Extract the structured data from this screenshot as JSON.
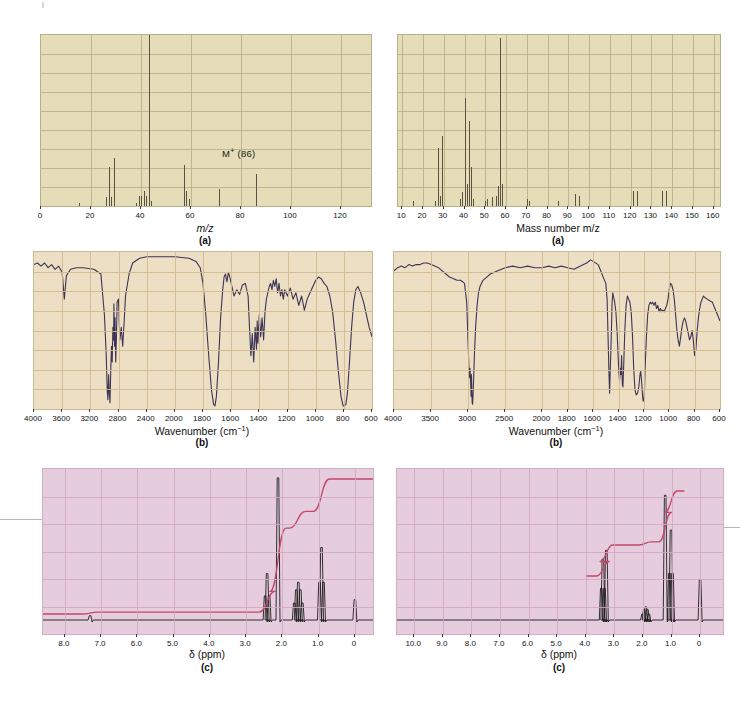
{
  "figure": {
    "panels": [
      {
        "id": "ms-left",
        "type": "mass-spectrum",
        "sublabel": "(a)",
        "axis_title": "m/z"
      },
      {
        "id": "ms-right",
        "type": "mass-spectrum",
        "sublabel": "(a)",
        "axis_title": "Mass number m/z"
      },
      {
        "id": "ir-left",
        "type": "infrared",
        "sublabel": "(b)",
        "axis_title": "Wavenumber (cm",
        "axis_title_sup": "-1",
        "axis_title_tail": ")"
      },
      {
        "id": "ir-right",
        "type": "infrared",
        "sublabel": "(b)",
        "axis_title": "Wavenumber (cm",
        "axis_title_sup": "-1",
        "axis_title_tail": ")"
      },
      {
        "id": "nmr-left",
        "type": "nmr",
        "sublabel": "(c)",
        "axis_title": "δ (ppm)"
      },
      {
        "id": "nmr-right",
        "type": "nmr",
        "sublabel": "(c)",
        "axis_title": "δ (ppm)"
      }
    ],
    "colors": {
      "ms_background": "#e4ddb8",
      "ir_background": "#ecdfc4",
      "nmr_background": "#e6cddd",
      "peak": "#5a5242",
      "trace": "#3d3456",
      "integral": "#c4466b",
      "nmr_trace": "#1c1c1c",
      "grid_ms": "#b0a884",
      "grid_ir": "#d3b98f",
      "grid_nmr": "#cfa8c0"
    }
  },
  "chart_data": [
    {
      "id": "ms-left",
      "type": "bar",
      "title": "",
      "xlabel": "m/z",
      "ylabel": "",
      "sublabel": "(a)",
      "xlim": [
        0,
        132
      ],
      "ylim": [
        0,
        100
      ],
      "xticks": [
        0,
        20,
        40,
        60,
        80,
        100,
        120
      ],
      "xtick_labels": [
        "0",
        "20",
        "40",
        "60",
        "80",
        "100",
        "120"
      ],
      "grid": true,
      "annotations": [
        {
          "text": "M+ (86)",
          "x": 86,
          "y": 27,
          "sup": "+",
          "base": "M",
          "tail": " (86)"
        }
      ],
      "categories": [
        15,
        26,
        27,
        28,
        29,
        38,
        39,
        40,
        41,
        42,
        43,
        44,
        57,
        58,
        59,
        71,
        86
      ],
      "values": [
        2,
        5,
        23,
        5,
        28,
        2,
        6,
        6,
        9,
        6,
        100,
        3,
        24,
        9,
        4,
        10,
        19
      ]
    },
    {
      "id": "ms-right",
      "type": "bar",
      "title": "",
      "xlabel": "Mass number m/z",
      "ylabel": "",
      "sublabel": "(a)",
      "xlim": [
        8,
        163
      ],
      "ylim": [
        0,
        100
      ],
      "xticks": [
        10,
        20,
        30,
        40,
        50,
        60,
        70,
        80,
        90,
        100,
        110,
        120,
        130,
        140,
        150,
        160
      ],
      "xtick_labels": [
        "10",
        "20",
        "30",
        "40",
        "50",
        "60",
        "70",
        "80",
        "90",
        "100",
        "110",
        "120",
        "130",
        "140",
        "150",
        "160"
      ],
      "grid": true,
      "annotations": [],
      "categories": [
        15,
        26,
        27,
        28,
        29,
        38,
        39,
        40,
        41,
        42,
        43,
        44,
        50,
        51,
        53,
        55,
        56,
        57,
        58,
        70,
        71,
        85,
        93,
        95,
        121,
        123,
        135,
        137
      ],
      "values": [
        3,
        3,
        34,
        6,
        41,
        4,
        8,
        63,
        13,
        50,
        23,
        4,
        3,
        4,
        5,
        6,
        12,
        98,
        13,
        4,
        3,
        3,
        7,
        6,
        9,
        9,
        9,
        9
      ]
    },
    {
      "id": "ir-left",
      "type": "line",
      "title": "",
      "xlabel": "Wavenumber (cm-1)",
      "ylabel": "",
      "sublabel": "(b)",
      "xlim": [
        4000,
        600
      ],
      "ylim": [
        0,
        100
      ],
      "xticks": [
        4000,
        3600,
        3200,
        2800,
        2400,
        2000,
        1800,
        1600,
        1400,
        1200,
        1000,
        800,
        600
      ],
      "xtick_labels": [
        "4000",
        "3600",
        "3200",
        "2800",
        "2400",
        "2000",
        "1800",
        "1600",
        "1400",
        "1200",
        "1000",
        "800",
        "600"
      ],
      "grid": true,
      "notes": "transmittance trace; strong C-H ~2950, strong C=O ~1715, strong band ~790"
    },
    {
      "id": "ir-right",
      "type": "line",
      "title": "",
      "xlabel": "Wavenumber (cm-1)",
      "ylabel": "",
      "sublabel": "(b)",
      "xlim": [
        4000,
        600
      ],
      "ylim": [
        0,
        100
      ],
      "xticks": [
        4000,
        3500,
        3000,
        2500,
        2000,
        1800,
        1600,
        1400,
        1200,
        1000,
        800,
        600
      ],
      "xtick_labels": [
        "4000",
        "3500",
        "3000",
        "2500",
        "2000",
        "1800",
        "1600",
        "1400",
        "1200",
        "1000",
        "800",
        "600"
      ],
      "grid": true,
      "notes": "transmittance trace; very strong C-H ~2960, fingerprint bands 1470-1200"
    },
    {
      "id": "nmr-left",
      "type": "line",
      "title": "",
      "xlabel": "δ (ppm)",
      "ylabel": "",
      "sublabel": "(c)",
      "xlim": [
        8.6,
        -0.5
      ],
      "ylim": [
        0,
        100
      ],
      "xticks": [
        8.0,
        7.0,
        6.0,
        5.0,
        4.0,
        3.0,
        2.0,
        1.0,
        0
      ],
      "xtick_labels": [
        "8.0",
        "7.0",
        "6.0",
        "5.0",
        "4.0",
        "3.0",
        "2.0",
        "1.0",
        "0"
      ],
      "grid": true,
      "has_integral": true,
      "peaks": [
        {
          "shift": 7.3,
          "height": 3,
          "label": "solvent"
        },
        {
          "shift": 2.42,
          "height": 32,
          "label": "triplet"
        },
        {
          "shift": 2.12,
          "height": 98,
          "label": "singlet"
        },
        {
          "shift": 1.58,
          "height": 26,
          "label": "multiplet"
        },
        {
          "shift": 0.92,
          "height": 50,
          "label": "triplet"
        },
        {
          "shift": 0.0,
          "height": 14,
          "label": "TMS"
        }
      ]
    },
    {
      "id": "nmr-right",
      "type": "line",
      "title": "",
      "xlabel": "δ (ppm)",
      "ylabel": "",
      "sublabel": "(c)",
      "xlim": [
        10.6,
        -0.8
      ],
      "ylim": [
        0,
        100
      ],
      "xticks": [
        10.0,
        9.0,
        8.0,
        7.0,
        6.0,
        5.0,
        4.0,
        3.0,
        2.0,
        1.0,
        0
      ],
      "xtick_labels": [
        "10.0",
        "9.0",
        "8.0",
        "7.0",
        "6.0",
        "5.0",
        "4.0",
        "3.0",
        "2.0",
        "1.0",
        "0"
      ],
      "grid": true,
      "has_integral": true,
      "peaks": [
        {
          "shift": 3.4,
          "height": 42,
          "label": "triplet"
        },
        {
          "shift": 3.28,
          "height": 48,
          "label": "singlet"
        },
        {
          "shift": 1.92,
          "height": 9,
          "label": "multiplet"
        },
        {
          "shift": 1.22,
          "height": 86,
          "label": "singlet"
        },
        {
          "shift": 1.02,
          "height": 62,
          "label": "triplet"
        },
        {
          "shift": 0.0,
          "height": 28,
          "label": "TMS"
        }
      ]
    }
  ]
}
